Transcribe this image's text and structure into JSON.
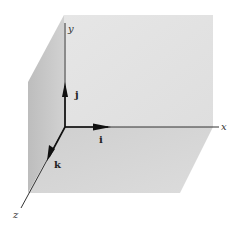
{
  "figure": {
    "axes": [
      {
        "name": "x",
        "label": "x"
      },
      {
        "name": "y",
        "label": "y"
      },
      {
        "name": "z",
        "label": "z"
      }
    ],
    "unit_vectors": [
      {
        "name": "i",
        "label": "i",
        "along": "x"
      },
      {
        "name": "j",
        "label": "j",
        "along": "y"
      },
      {
        "name": "k",
        "label": "k",
        "along": "z"
      }
    ],
    "colors": {
      "background": "#ffffff",
      "plane_back": "#e4e4e4",
      "plane_left": "#c8c8c8",
      "plane_bottom": "#d6d6d6",
      "axis": "#333333"
    }
  }
}
